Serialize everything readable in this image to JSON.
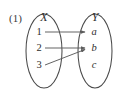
{
  "figure": {
    "number_label": "(1)",
    "type": "mapping-diagram",
    "domain_set": {
      "name": "X",
      "elements": [
        "1",
        "2",
        "3"
      ]
    },
    "codomain_set": {
      "name": "Y",
      "elements": [
        "a",
        "b",
        "c"
      ]
    },
    "mappings": [
      {
        "from": "1",
        "to": "a"
      },
      {
        "from": "2",
        "to": "b"
      },
      {
        "from": "3",
        "to": "b"
      }
    ],
    "unmapped_codomain_elements": [
      "c"
    ],
    "colors": {
      "background": "#ffffff",
      "outline": "#4a4a4a",
      "arrow": "#5c5c5c",
      "text": "#2e2e2e"
    }
  }
}
